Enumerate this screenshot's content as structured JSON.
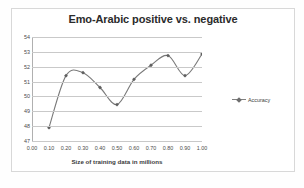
{
  "chart_data": {
    "type": "line",
    "title": "Emo-Arabic positive vs. negative",
    "xlabel": "Size of training data in millions",
    "ylabel": "",
    "xlim": [
      0.0,
      1.0
    ],
    "ylim": [
      47,
      54
    ],
    "grid": true,
    "legend_position": "right",
    "x": [
      0.1,
      0.2,
      0.3,
      0.4,
      0.5,
      0.6,
      0.7,
      0.8,
      0.9,
      1.0
    ],
    "xtick_labels": [
      "0.00",
      "0.10",
      "0.20",
      "0.30",
      "0.40",
      "0.50",
      "0.60",
      "0.70",
      "0.80",
      "0.90",
      "1.00"
    ],
    "ytick_labels": [
      "47",
      "48",
      "49",
      "50",
      "51",
      "52",
      "53",
      "54"
    ],
    "series": [
      {
        "name": "Accuracy",
        "marker": "diamond",
        "color": "#7a7a7a",
        "smooth": true,
        "values": [
          47.9,
          51.4,
          51.6,
          50.6,
          49.45,
          51.15,
          52.1,
          52.75,
          51.4,
          52.85
        ]
      }
    ]
  },
  "legend": {
    "entry_label": "Accuracy"
  }
}
